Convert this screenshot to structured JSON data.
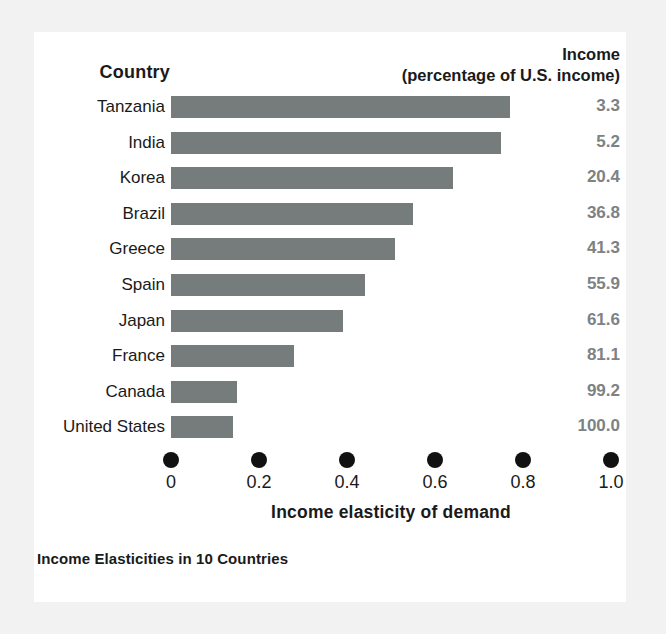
{
  "header": {
    "country_label": "Country",
    "income_line1": "Income",
    "income_line2": "(percentage of U.S. income)"
  },
  "caption": "Income Elasticities in 10 Countries",
  "colors": {
    "bar": "#767b7b",
    "value_text": "#7d8284",
    "tick": "#111111",
    "card_bg": "#ffffff",
    "page_bg": "#f2f2f2"
  },
  "chart_data": {
    "type": "bar",
    "orientation": "horizontal",
    "title": "Income Elasticities in 10 Countries",
    "xlabel": "Income elasticity of demand",
    "ylabel": "Country",
    "xlim": [
      0,
      1.0
    ],
    "grid": false,
    "legend": "none",
    "xticks": [
      "0",
      "0.2",
      "0.4",
      "0.6",
      "0.8",
      "1.0"
    ],
    "xtick_values": [
      0,
      0.2,
      0.4,
      0.6,
      0.8,
      1.0
    ],
    "categories": [
      "Tanzania",
      "India",
      "Korea",
      "Brazil",
      "Greece",
      "Spain",
      "Japan",
      "France",
      "Canada",
      "United States"
    ],
    "values": [
      0.77,
      0.75,
      0.64,
      0.55,
      0.51,
      0.44,
      0.39,
      0.28,
      0.15,
      0.14
    ],
    "series": [
      {
        "name": "Income elasticity of demand",
        "values": [
          0.77,
          0.75,
          0.64,
          0.55,
          0.51,
          0.44,
          0.39,
          0.28,
          0.15,
          0.14
        ]
      }
    ],
    "secondary_column": {
      "name": "Income (percentage of U.S. income)",
      "values": [
        "3.3",
        "5.2",
        "20.4",
        "36.8",
        "41.3",
        "55.9",
        "61.6",
        "81.1",
        "99.2",
        "100.0"
      ]
    },
    "rows": [
      {
        "country": "Tanzania",
        "elasticity": 0.77,
        "income": "3.3"
      },
      {
        "country": "India",
        "elasticity": 0.75,
        "income": "5.2"
      },
      {
        "country": "Korea",
        "elasticity": 0.64,
        "income": "20.4"
      },
      {
        "country": "Brazil",
        "elasticity": 0.55,
        "income": "36.8"
      },
      {
        "country": "Greece",
        "elasticity": 0.51,
        "income": "41.3"
      },
      {
        "country": "Spain",
        "elasticity": 0.44,
        "income": "55.9"
      },
      {
        "country": "Japan",
        "elasticity": 0.39,
        "income": "61.6"
      },
      {
        "country": "France",
        "elasticity": 0.28,
        "income": "81.1"
      },
      {
        "country": "Canada",
        "elasticity": 0.15,
        "income": "99.2"
      },
      {
        "country": "United States",
        "elasticity": 0.14,
        "income": "100.0"
      }
    ]
  }
}
